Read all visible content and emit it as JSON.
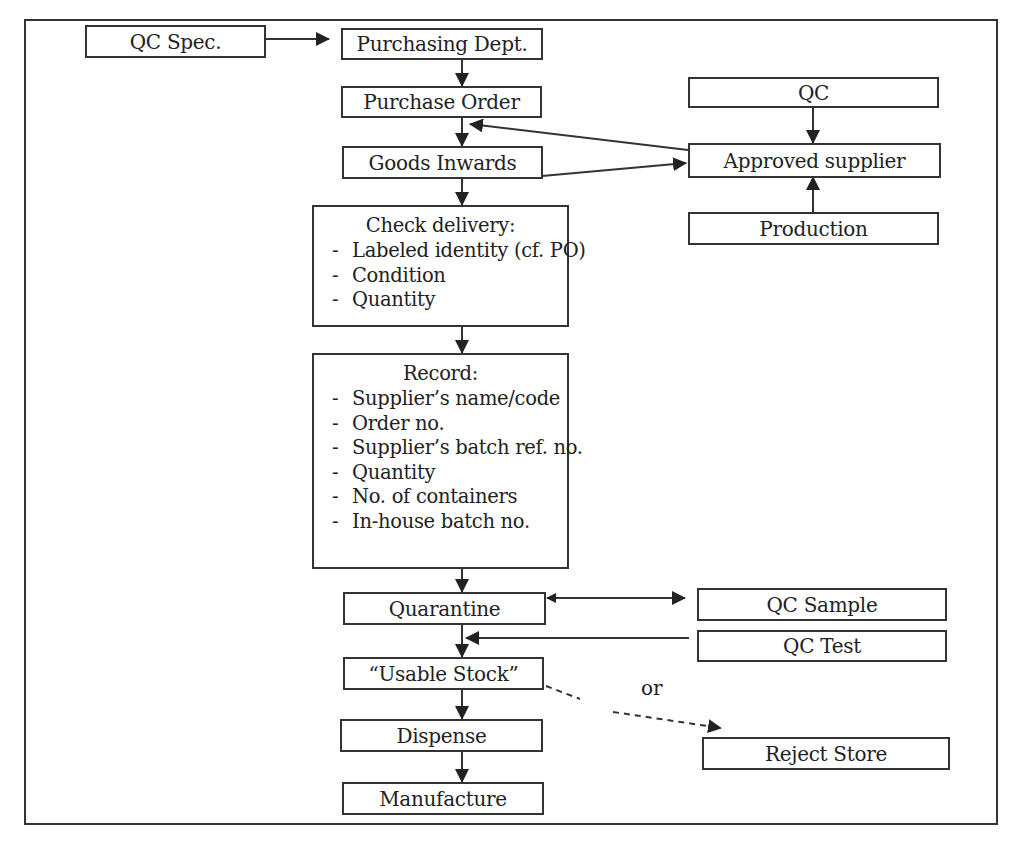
{
  "diagram": {
    "type": "flowchart",
    "title": "",
    "nodes": {
      "qc_spec": "QC Spec.",
      "purchasing_dept": "Purchasing Dept.",
      "purchase_order": "Purchase Order",
      "goods_inwards": "Goods Inwards",
      "check_delivery": {
        "title": "Check delivery:",
        "items": [
          "Labeled identity (cf. PO)",
          "Condition",
          "Quantity"
        ]
      },
      "record": {
        "title": "Record:",
        "items": [
          "Supplier’s name/code",
          "Order no.",
          "Supplier’s batch ref. no.",
          "Quantity",
          "No. of containers",
          "In-house batch no."
        ]
      },
      "quarantine": "Quarantine",
      "usable_stock": "“Usable Stock”",
      "dispense": "Dispense",
      "manufacture": "Manufacture",
      "qc": "QC",
      "approved_supplier": "Approved supplier",
      "production": "Production",
      "qc_sample": "QC Sample",
      "qc_test": "QC Test",
      "reject_store": "Reject Store"
    },
    "bullet": "-",
    "or_label": "or",
    "edges": [
      {
        "from": "QC Spec.",
        "to": "Purchasing Dept.",
        "style": "solid"
      },
      {
        "from": "Purchasing Dept.",
        "to": "Purchase Order",
        "style": "solid"
      },
      {
        "from": "Purchase Order",
        "to": "Goods Inwards",
        "style": "solid"
      },
      {
        "from": "Approved supplier",
        "to": "Purchase Order",
        "style": "solid"
      },
      {
        "from": "Goods Inwards",
        "to": "Approved supplier",
        "style": "solid"
      },
      {
        "from": "QC",
        "to": "Approved supplier",
        "style": "solid"
      },
      {
        "from": "Production",
        "to": "Approved supplier",
        "style": "solid"
      },
      {
        "from": "Goods Inwards",
        "to": "Check delivery",
        "style": "solid"
      },
      {
        "from": "Check delivery",
        "to": "Record",
        "style": "solid"
      },
      {
        "from": "Record",
        "to": "Quarantine",
        "style": "solid"
      },
      {
        "from": "Quarantine",
        "to": "QC Sample",
        "style": "solid-bidirectional"
      },
      {
        "from": "Quarantine",
        "to": "Usable Stock",
        "style": "solid"
      },
      {
        "from": "QC Test",
        "to": "Quarantine-Usable Stock link",
        "style": "solid"
      },
      {
        "from": "Usable Stock",
        "to": "Reject Store",
        "style": "dashed",
        "label": "or"
      },
      {
        "from": "Usable Stock",
        "to": "Dispense",
        "style": "solid"
      },
      {
        "from": "Dispense",
        "to": "Manufacture",
        "style": "solid"
      }
    ],
    "colors": {
      "line": "#333333",
      "background": "#ffffff",
      "text": "#222222"
    }
  }
}
